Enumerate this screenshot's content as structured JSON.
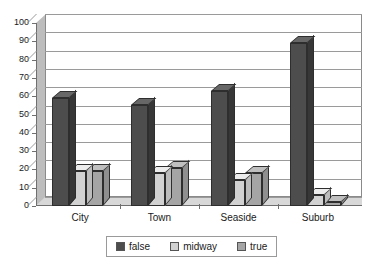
{
  "chart_data": {
    "type": "bar",
    "title": "",
    "subtitle": "",
    "xlabel": "",
    "ylabel": "",
    "categories": [
      "City",
      "Town",
      "Seaside",
      "Suburb"
    ],
    "series": [
      {
        "name": "false",
        "values": [
          59,
          55,
          63,
          89
        ],
        "color": "#4d4d4d"
      },
      {
        "name": "midway",
        "values": [
          19,
          18,
          14,
          6
        ],
        "color": "#d2d2d2"
      },
      {
        "name": "true",
        "values": [
          19,
          21,
          18,
          2
        ],
        "color": "#a5a5a5"
      }
    ],
    "ylim": [
      0,
      100
    ],
    "ytick_step": 10,
    "yticks": [
      0,
      10,
      20,
      30,
      40,
      50,
      60,
      70,
      80,
      90,
      100
    ],
    "ytick_labels": [
      "0",
      "10",
      "20",
      "30",
      "40",
      "50",
      "60",
      "70",
      "80",
      "90",
      "100"
    ],
    "grid": true,
    "grid_axis": "y",
    "legend": true,
    "legend_position": "bottom-center",
    "style": "3d-bar",
    "background_color": "#ffffff",
    "axis_color": "#6f6f6f",
    "grid_color": "#9a9a9a",
    "bar_outline_color": "#2e2e2e",
    "depth_face_color": "#bdbdbd",
    "floor_color": "#d8d8d8"
  },
  "legend": {
    "items": [
      {
        "label": "false",
        "color": "#4d4d4d"
      },
      {
        "label": "midway",
        "color": "#d2d2d2"
      },
      {
        "label": "true",
        "color": "#a5a5a5"
      }
    ]
  }
}
